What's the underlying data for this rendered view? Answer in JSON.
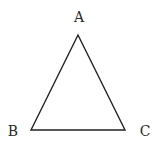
{
  "diagram": {
    "type": "triangle",
    "stroke_color": "#222222",
    "vertices": [
      {
        "label": "A",
        "x": 78,
        "y": 35,
        "label_x": 79,
        "label_y": 22
      },
      {
        "label": "B",
        "x": 31,
        "y": 130,
        "label_x": 13,
        "label_y": 136
      },
      {
        "label": "C",
        "x": 125,
        "y": 130,
        "label_x": 145,
        "label_y": 136
      }
    ]
  }
}
